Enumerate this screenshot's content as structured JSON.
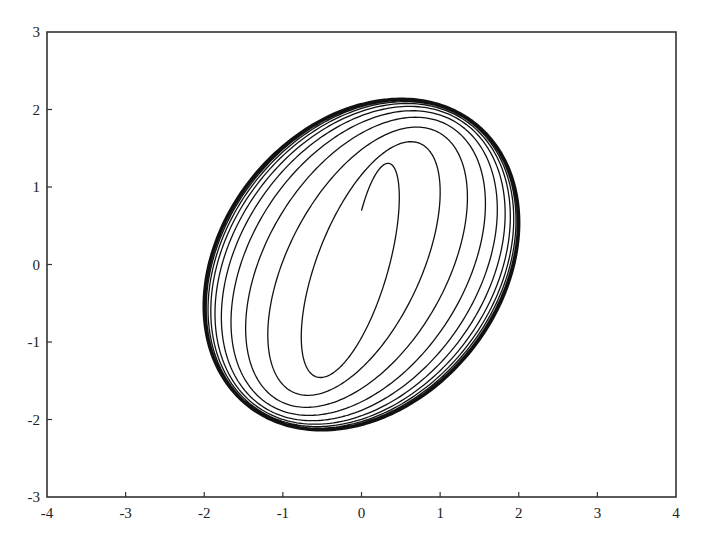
{
  "chart_data": {
    "type": "line",
    "title": "",
    "xlabel": "",
    "ylabel": "",
    "xlim": [
      -4,
      4
    ],
    "ylim": [
      -3,
      3
    ],
    "grid": false,
    "legend": null,
    "x_ticks": [
      -4,
      -3,
      -2,
      -1,
      0,
      1,
      2,
      3,
      4
    ],
    "y_ticks": [
      -3,
      -2,
      -1,
      0,
      1,
      2,
      3
    ],
    "x_tick_labels": [
      "-4",
      "-3",
      "-2",
      "-1",
      "0",
      "1",
      "2",
      "3",
      "4"
    ],
    "y_tick_labels": [
      "-3",
      "-2",
      "-1",
      "0",
      "1",
      "2",
      "3"
    ],
    "series": [
      {
        "name": "trajectory",
        "model": "x = a(s)·sin(t), y = b(s)·sin(t + d(s)), s = t/2π, e = exp(-s/tau)",
        "params": {
          "loops": 14,
          "tau": 2.4,
          "a_final": 2.02,
          "a_delta": 1.72,
          "b_final": 2.15,
          "b_delta": 0.9,
          "d_final": 1.32,
          "d_delta": 0.73
        },
        "key_points": [
          {
            "label": "innermost loop top",
            "x": 0.25,
            "y": 1.25
          },
          {
            "label": "innermost loop bottom",
            "x": -0.25,
            "y": -1.25
          },
          {
            "label": "second loop top",
            "x": 0.62,
            "y": 1.55
          },
          {
            "label": "limit cycle leftmost",
            "x": -2.0,
            "y": -0.5
          },
          {
            "label": "limit cycle rightmost",
            "x": 2.05,
            "y": 0.5
          },
          {
            "label": "limit cycle top",
            "x": 0.5,
            "y": 2.15
          },
          {
            "label": "limit cycle bottom",
            "x": -0.5,
            "y": -2.15
          }
        ]
      }
    ]
  },
  "plot_area": {
    "left": 47,
    "top": 32,
    "right": 676,
    "bottom": 497
  }
}
